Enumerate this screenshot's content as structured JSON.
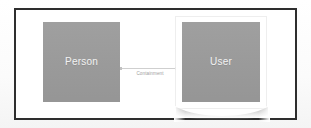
{
  "canvas": {
    "background_color": "#fdfdfd",
    "frame_border_color": "#2e2e2e",
    "node_fill_color": "#9b9b9b",
    "node_label_color": "#f2f2f2",
    "connector_color": "#cfcfcf",
    "connector_label_color": "#9e9e9e",
    "selection_frame_color": "#ffffff"
  },
  "nodes": [
    {
      "id": "person",
      "label": "Person",
      "selected": false
    },
    {
      "id": "user",
      "label": "User",
      "selected": true
    }
  ],
  "connectors": [
    {
      "id": "person-to-user",
      "label": "Containment",
      "from": "person",
      "to": "user"
    }
  ]
}
